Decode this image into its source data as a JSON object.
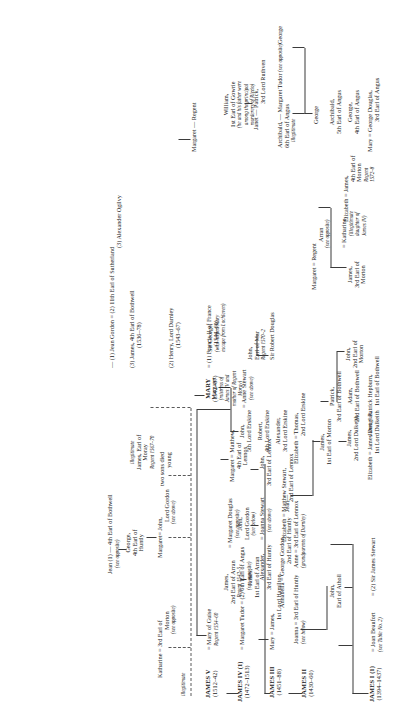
{
  "document": {
    "type": "genealogical-table",
    "title": "The Stewarts",
    "orientation": "rotated-90-ccw"
  },
  "people": {
    "james1": {
      "name": "JAMES I (1)",
      "dates": "(1394–1437)"
    },
    "joan_beaufort": {
      "name": "= Joan Beaufort",
      "note": "(see Table No. 2)"
    },
    "sir_james_stewart": {
      "name": "= (2) Sir James Stewart"
    },
    "john_atholl": {
      "name": "John,",
      "line2": "Earl of Atholl"
    },
    "joanna_huntly": {
      "name": "Joanna = 3rd Earl of Huntly",
      "note": "(see below)"
    },
    "anne_lennox": {
      "name": "Anne = 3rd Earl of Lennox",
      "note": "(grandparents of Darnley)"
    },
    "elizabeth_dalkeith": {
      "name": "Elizabeth  =  James Douglas,",
      "line2": "1st Lord Dalkeith"
    },
    "james_2nd_dalkeith": {
      "name": "James,",
      "line2": "2nd Lord Dalkeith"
    },
    "james_1st_morton": {
      "name": "James,",
      "line2": "1st Earl of Morton"
    },
    "james2": {
      "name": "JAMES II",
      "dates": "(1430–60)"
    },
    "james3": {
      "name": "JAMES III",
      "dates": "(1451–88)"
    },
    "james4": {
      "name": "JAMES IV (1)",
      "dates": "(1472–1513)"
    },
    "james5": {
      "name": "JAMES V",
      "dates": "(1512–42)"
    },
    "mary_hamilton": {
      "name": "Mary = James,",
      "line2": "1st Lord Hamilton"
    },
    "james_1st_arran": {
      "name": "James,",
      "line2": "1st Earl of Arran"
    },
    "james_2nd_arran": {
      "name": "James,",
      "line2": "2nd Earl of Arran",
      "line3": "Regent 1542–5"
    },
    "margaret_douglas": {
      "name": "= Margaret Douglas",
      "note": "(see opposite)"
    },
    "margaret_tudor": {
      "name": "= Margaret Tudor",
      "spouse2": "= (2) 6th Earl of Angus",
      "note": "(see opposite)"
    },
    "mary_of_guise": {
      "name": "= Mary of Guise",
      "note": "Regent 1554–60"
    },
    "annabella_gordon": {
      "name": "Annabella = George Gordon,",
      "line2": "2nd Earl of Huntly"
    },
    "alexander_huntly": {
      "name": "Alexander,",
      "line2": "3rd Earl of Huntly",
      "spouse": "= Joanna Stewart",
      "note": "(see above)"
    },
    "john_lord_gordon": {
      "name": "John,",
      "line2": "Lord Gordon",
      "note": "(see below)"
    },
    "elizabeth_matthew": {
      "name": "Elizabeth = Matthew Stewart,",
      "line2": "2nd Earl of Lennox"
    },
    "john_3rd_lennox": {
      "name": "John,",
      "line2": "3rd Earl of Lennox"
    },
    "matthew_4th_lennox": {
      "name": "Margaret = Matthew,",
      "line2": "4th Earl of",
      "line3": "Lennox"
    },
    "jean": {
      "name": "Jean—"
    },
    "elizabeth_erskine": {
      "name": "Elizabeth  =  Thomas,",
      "line2": "2nd Lord Erskine"
    },
    "alexander_erskine": {
      "name": "Alexander,",
      "line2": "3rd Lord Erskine"
    },
    "robert_erskine": {
      "name": "Robert,",
      "line2": "4th Lord Erskine"
    },
    "john_erskine": {
      "name": "John,",
      "line2": "5th Lord Erskine",
      "spouse": "= Anne Stewart",
      "note": "(see above)"
    },
    "margaret_mistress": {
      "name": "Margaret",
      "note": "(mistress of",
      "note2": "James IV and",
      "note3": "mother of Regent",
      "note4": "Moray)"
    },
    "sir_robert_douglas": {
      "name": "Sir Robert Douglas"
    },
    "john_earl_mar": {
      "name": "John,",
      "line2": "Earl of Mar",
      "line3": "Regent 1570–2"
    },
    "sir_george": {
      "name": "Sir George,",
      "note": "(who helped Mary",
      "note2": "escape from Lochleven)"
    },
    "janet_hepburn": {
      "name": "Janet  =  Patrick Hepburn,",
      "line2": "1st Earl of Bothwell"
    },
    "adam_bothwell": {
      "name": "Adam,",
      "line2": "2nd Earl of Bothwell"
    },
    "patrick_bothwell": {
      "name": "Patrick,",
      "line2": "3rd Earl of Bothwell"
    },
    "john_2nd_morton": {
      "name": "John,",
      "line2": "2nd Earl of",
      "line3": "Morton"
    },
    "james_3rd_morton": {
      "name": "James,",
      "line2": "3rd Earl of",
      "line3": "Morton"
    },
    "katharine_illeg": {
      "name": "=   Katharine,",
      "note": "(illegitimate",
      "note2": "daughter of",
      "note3": "James IV)"
    },
    "margaret_regent_arran": {
      "name": "Margaret = Regent",
      "line2": "Arran",
      "note": "(see opposite)"
    },
    "elizabeth_4th_morton": {
      "name": "Elizabeth = James,",
      "line2": "4th Earl of",
      "line3": "Morton",
      "note": "Regent",
      "note2": "1572–8"
    },
    "mary_douglas_angus": {
      "name": "Mary =  George Douglas,",
      "line2": "3rd Earl of Angus"
    },
    "george_4th_angus": {
      "name": "George,",
      "line2": "4th Earl of Angus"
    },
    "archibald_5th_angus": {
      "name": "Archibald,",
      "line2": "5th Earl of Angus"
    },
    "george_son": {
      "name": "George"
    },
    "archibald_6th_angus": {
      "name": "Archibald,",
      "line2": "6th Earl of Angus",
      "spouse": "—  Margaret Tudor",
      "note": "(see opposite)",
      "note2": "illegitimate"
    },
    "george_top": {
      "name": "George"
    },
    "janet_ruthven": {
      "name": "Janet — Patrick,",
      "line2": "3rd Lord Ruthven"
    },
    "william_gowrie": {
      "name": "William,",
      "line2": "1st Earl of Gowrie",
      "note": "(he and his father were",
      "note2": "among the principal",
      "note3": "murderers of Rizzio)"
    },
    "margaret_regent": {
      "name": "Margaret — Regent"
    },
    "katharine_morton": {
      "name": "Katharine = 3rd Earl of",
      "line2": "Morton",
      "note": "(see opposite)"
    },
    "margaret_gordon": {
      "name": "Margaret= John,",
      "line2": "Lord Gordon",
      "note": "(see above)"
    },
    "george_4th_huntly": {
      "name": "George,",
      "line2": "4th Earl of",
      "line3": "Huntly"
    },
    "jean_gordon_bothwell": {
      "name": "Jean (1) — 4th Earl of Bothwell",
      "note": "(see opposite)"
    },
    "two_sons": {
      "name": "two sons died",
      "line2": "young"
    },
    "james_moray": {
      "name": "James, Earl of",
      "line2": "Moray",
      "line3": "Regent 1567–70",
      "note": "illegitimate"
    },
    "mary_queen": {
      "name": "MARY",
      "dates": "(1542–87)"
    },
    "francis2": {
      "name": "= (1) Francis II of France",
      "dates": "(1544–60)"
    },
    "darnley": {
      "name": "(2) Henry, Lord Darnley",
      "dates": "(1543–67)"
    },
    "bothwell": {
      "name": "(3) James, 4th Earl of Bothwell",
      "dates": "(1536–78)"
    },
    "jean_gordon_marriages": {
      "name": "—  (1) Jean Gordon  =",
      "m2": "(2) 11th Earl of Sutherland",
      "m3": "(3) Alexander Ogilvy"
    },
    "illegitimate_label": {
      "name": "illegitimate"
    }
  }
}
